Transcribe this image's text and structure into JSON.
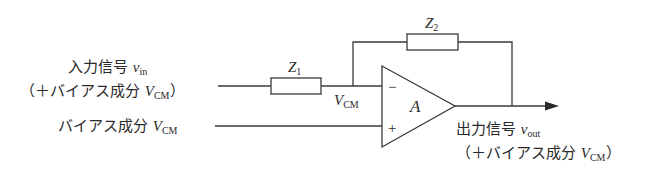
{
  "diagram": {
    "type": "op-amp inverting amplifier with bias",
    "input_label": {
      "line1_text": "入力信号 ",
      "line1_var": "v",
      "line1_sub": "in",
      "line2_prefix": "（＋バイアス成分 ",
      "line2_var": "V",
      "line2_sub": "CM",
      "line2_suffix": "）"
    },
    "bias_label": {
      "text": "バイアス成分 ",
      "var": "V",
      "sub": "CM"
    },
    "components": {
      "z1": {
        "var": "Z",
        "sub": "1"
      },
      "z2": {
        "var": "Z",
        "sub": "2"
      },
      "amp": {
        "label": "A",
        "minus": "−",
        "plus": "+"
      }
    },
    "node_label": {
      "var": "V",
      "sub": "CM"
    },
    "output_label": {
      "line1_text": "出力信号 ",
      "line1_var": "v",
      "line1_sub": "out",
      "line2_prefix": "（＋バイアス成分 ",
      "line2_var": "V",
      "line2_sub": "CM",
      "line2_suffix": "）"
    },
    "colors": {
      "line": "#3a3a3a",
      "text": "#2a2a2a",
      "background": "#ffffff"
    }
  }
}
